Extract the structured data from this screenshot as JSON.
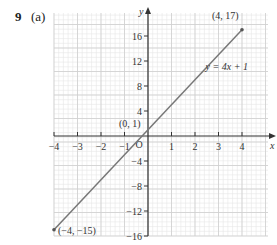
{
  "question": {
    "number": "9",
    "part": "(a)"
  },
  "chart_data": {
    "type": "line",
    "title": "",
    "xlabel": "x",
    "ylabel": "y",
    "xlim": [
      -4.3,
      4.8
    ],
    "ylim": [
      -16,
      19.5
    ],
    "grid": true,
    "x_ticks": [
      -4,
      -3,
      -2,
      -1,
      1,
      2,
      3,
      4
    ],
    "x_tick_labels": [
      "−4",
      "−3",
      "−2",
      "−1",
      "1",
      "2",
      "3",
      "4"
    ],
    "y_ticks": [
      16,
      12,
      8,
      4,
      -4,
      -8,
      -12,
      -16
    ],
    "y_tick_labels": [
      "16",
      "12",
      "8",
      "4",
      "−4",
      "−8",
      "−12",
      "−16"
    ],
    "origin_label": "O",
    "series": [
      {
        "name": "y = 4x + 1",
        "x": [
          -4,
          4
        ],
        "y": [
          -15,
          17
        ],
        "color": "#777777"
      }
    ],
    "points": [
      {
        "x": -4,
        "y": -15,
        "label": "(−4, −15)"
      },
      {
        "x": 0,
        "y": 1,
        "label": "(0, 1)"
      },
      {
        "x": 4,
        "y": 17,
        "label": "(4, 17)"
      }
    ],
    "annotations": [
      {
        "text": "y = 4x + 1",
        "x": 3.0,
        "y": 10.5
      }
    ]
  },
  "colors": {
    "grid_minor": "#e6e6e6",
    "grid_major": "#cfcfcf",
    "axis": "#333333",
    "line": "#777777"
  }
}
